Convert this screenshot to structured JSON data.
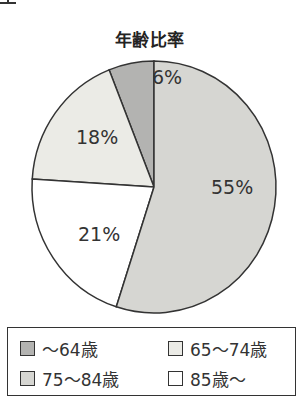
{
  "title": "年齢比率",
  "chart_data": {
    "type": "pie",
    "title": "年齢比率",
    "categories": [
      "〜64歳",
      "65〜74歳",
      "75〜84歳",
      "85歳〜"
    ],
    "values": [
      6,
      18,
      55,
      21
    ],
    "labels": [
      "6%",
      "18%",
      "55%",
      "21%"
    ],
    "colors": [
      "#b3b3b1",
      "#ebebe6",
      "#d6d6d2",
      "#ffffff"
    ],
    "legend_position": "bottom"
  },
  "legend": {
    "items": [
      {
        "label": "〜64歳",
        "color": "#b3b3b1"
      },
      {
        "label": "65〜74歳",
        "color": "#ebebe6"
      },
      {
        "label": "75〜84歳",
        "color": "#d6d6d2"
      },
      {
        "label": "85歳〜",
        "color": "#ffffff"
      }
    ]
  }
}
